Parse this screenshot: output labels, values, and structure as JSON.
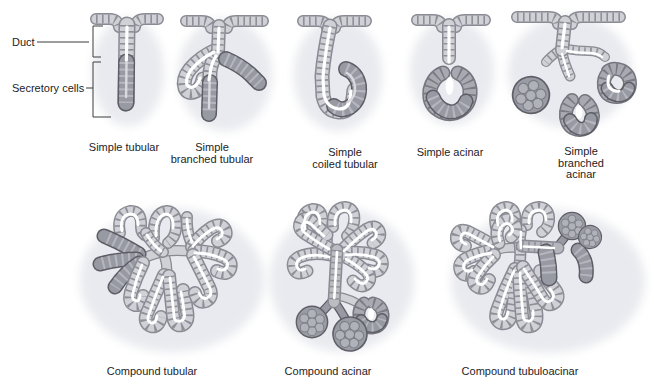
{
  "figure": {
    "type": "anatomy-diagram"
  },
  "annotations": {
    "duct_label": "Duct",
    "secretory_label": "Secretory cells"
  },
  "panels": [
    {
      "id": "simple-tubular",
      "label": "Simple tubular"
    },
    {
      "id": "simple-branched-tubular",
      "label": "Simple\nbranched tubular"
    },
    {
      "id": "simple-coiled-tubular",
      "label": "Simple\ncoiled tubular"
    },
    {
      "id": "simple-acinar",
      "label": "Simple acinar"
    },
    {
      "id": "simple-branched-acinar",
      "label": "Simple\nbranched acinar"
    },
    {
      "id": "compound-tubular",
      "label": "Compound tubular"
    },
    {
      "id": "compound-acinar",
      "label": "Compound acinar"
    },
    {
      "id": "compound-tubuloacinar",
      "label": "Compound tubuloacinar"
    }
  ],
  "palette": {
    "cell_light": "#d0d0d7",
    "cell_outline": "#8a8a93",
    "secretory_dark": "#989aa3",
    "secretory_outline": "#5d5d66",
    "tissue_wash": "#e9eaef",
    "lumen": "#ffffff",
    "text": "#1d1d1f"
  }
}
